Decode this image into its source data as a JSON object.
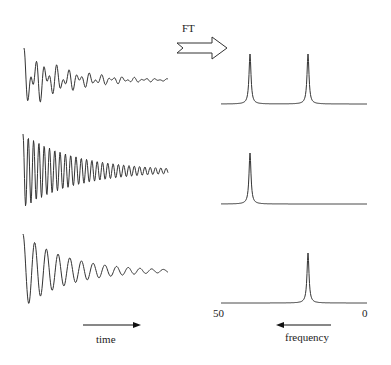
{
  "labels": {
    "ft": "FT",
    "time": "time",
    "frequency": "frequency",
    "freq_max": "50",
    "freq_min": "0"
  },
  "chart_data": [
    {
      "type": "line",
      "title": "FID 1 (two frequencies)",
      "xlabel": "time",
      "description": "Decaying oscillation with beating from two frequency components"
    },
    {
      "type": "line",
      "title": "Spectrum 1",
      "xlabel": "frequency",
      "xlim": [
        50,
        0
      ],
      "peaks": [
        {
          "freq": 37
        },
        {
          "freq": 17
        }
      ]
    },
    {
      "type": "line",
      "title": "FID 2 (high frequency)",
      "xlabel": "time",
      "description": "Decaying oscillation, high frequency"
    },
    {
      "type": "line",
      "title": "Spectrum 2",
      "xlabel": "frequency",
      "xlim": [
        50,
        0
      ],
      "peaks": [
        {
          "freq": 37
        }
      ]
    },
    {
      "type": "line",
      "title": "FID 3 (low frequency)",
      "xlabel": "time",
      "description": "Decaying oscillation, low frequency"
    },
    {
      "type": "line",
      "title": "Spectrum 3",
      "xlabel": "frequency",
      "xlim": [
        50,
        0
      ],
      "peaks": [
        {
          "freq": 17
        }
      ]
    }
  ]
}
